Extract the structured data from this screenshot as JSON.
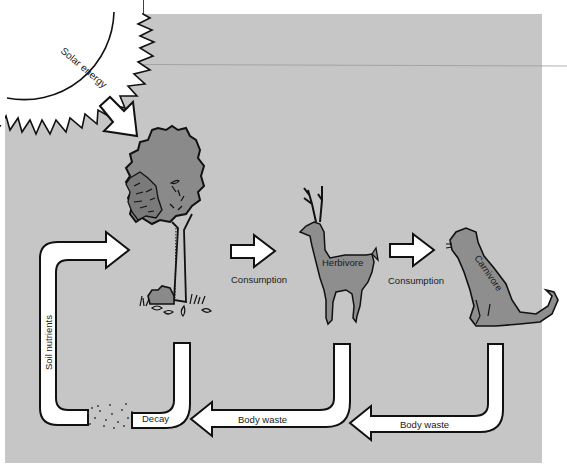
{
  "caption": {
    "top_text": "biosphere."
  },
  "colors": {
    "panel_bg": "#c6c6c6",
    "page_bg": "#ffffff",
    "organism_fill": "#8e8e8e",
    "foliage_dark": "#7c7c7c",
    "arrow_fill": "#ffffff",
    "outline": "#111111"
  },
  "labels": {
    "solar_energy": "Solar energy",
    "consumption_1": "Consumption",
    "consumption_2": "Consumption",
    "herbivore": "Herbivore",
    "carnivore": "Carnivore",
    "soil_nutrients": "Soil nutrients",
    "decay": "Decay",
    "body_waste_1": "Body waste",
    "body_waste_2": "Body waste"
  },
  "nodes": [
    {
      "id": "sun",
      "label": "Solar energy"
    },
    {
      "id": "producer",
      "label": "Tree"
    },
    {
      "id": "herbivore",
      "label": "Herbivore"
    },
    {
      "id": "carnivore",
      "label": "Carnivore"
    },
    {
      "id": "decay",
      "label": "Decay"
    }
  ],
  "edges": [
    {
      "from": "sun",
      "to": "producer",
      "label": ""
    },
    {
      "from": "producer",
      "to": "herbivore",
      "label": "Consumption"
    },
    {
      "from": "herbivore",
      "to": "carnivore",
      "label": "Consumption"
    },
    {
      "from": "carnivore",
      "to": "decay",
      "label": "Body waste"
    },
    {
      "from": "herbivore",
      "to": "decay",
      "label": "Body waste"
    },
    {
      "from": "producer",
      "to": "decay",
      "label": ""
    },
    {
      "from": "decay",
      "to": "producer",
      "label": "Soil nutrients"
    }
  ]
}
